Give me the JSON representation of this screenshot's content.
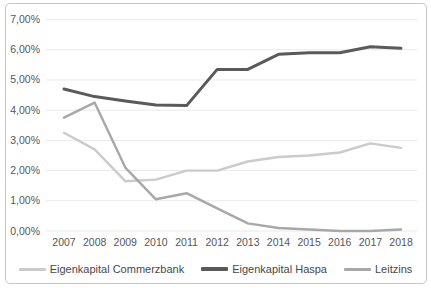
{
  "chart_data": {
    "type": "line",
    "title": "",
    "x_labels": [
      "2007",
      "2008",
      "2009",
      "2010",
      "2011",
      "2012",
      "2013",
      "2014",
      "2015",
      "2016",
      "2017",
      "2018"
    ],
    "ylim": [
      0,
      7
    ],
    "ytick_step": 1,
    "ytick_labels_bottom_to_top": [
      "0,00%",
      "1,00%",
      "2,00%",
      "3,00%",
      "4,00%",
      "5,00%",
      "6,00%",
      "7,00%"
    ],
    "grid": true,
    "legend_position": "bottom",
    "series": [
      {
        "name": "Eigenkapital Commerzbank",
        "color": "#cbcbcb",
        "stroke_width": 2.4,
        "values": [
          3.25,
          2.7,
          1.65,
          1.7,
          2.0,
          2.0,
          2.3,
          2.45,
          2.5,
          2.6,
          2.9,
          2.75
        ]
      },
      {
        "name": "Eigenkapital Haspa",
        "color": "#5a5a5a",
        "stroke_width": 3,
        "values": [
          4.7,
          4.45,
          4.3,
          4.17,
          4.15,
          5.35,
          5.35,
          5.85,
          5.9,
          5.9,
          6.1,
          6.05
        ]
      },
      {
        "name": "Leitzins",
        "color": "#a8a8a8",
        "stroke_width": 2.4,
        "values": [
          3.75,
          4.25,
          2.1,
          1.05,
          1.25,
          0.75,
          0.25,
          0.1,
          0.05,
          0.0,
          0.0,
          0.05
        ]
      }
    ],
    "colors": {
      "gridline": "#e9e9e9",
      "tick_label": "#565656",
      "frame_border": "#c6c6c6"
    }
  }
}
